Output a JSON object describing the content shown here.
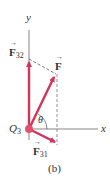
{
  "diagram": {
    "caption": "(b)",
    "axes": {
      "x_label": "x",
      "y_label": "y"
    },
    "charge": {
      "label": "Q",
      "subscript": "3"
    },
    "angle_label": "θ",
    "vectors": [
      {
        "name": "F32",
        "label": "F",
        "subscript": "32",
        "direction": "up along +y"
      },
      {
        "name": "F",
        "label": "F",
        "subscript": "",
        "direction": "resultant, up-right at angle θ"
      },
      {
        "name": "F31",
        "label": "F",
        "subscript": "31",
        "direction": "down-right"
      }
    ],
    "colors": {
      "vector": "#d2345a",
      "axis": "#555555",
      "dashed": "#555555",
      "charge": "#e2506a"
    }
  }
}
